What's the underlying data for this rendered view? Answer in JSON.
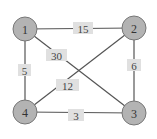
{
  "graph": {
    "nodes": [
      {
        "id": "1",
        "label": "1",
        "x": 25,
        "y": 29
      },
      {
        "id": "2",
        "label": "2",
        "x": 134,
        "y": 28
      },
      {
        "id": "3",
        "label": "3",
        "x": 134,
        "y": 113
      },
      {
        "id": "4",
        "label": "4",
        "x": 25,
        "y": 112
      }
    ],
    "edges": [
      {
        "from": "1",
        "to": "2",
        "weight": "15",
        "lx": 83,
        "ly": 28
      },
      {
        "from": "1",
        "to": "3",
        "weight": "30",
        "lx": 56,
        "ly": 55
      },
      {
        "from": "1",
        "to": "4",
        "weight": "5",
        "lx": 24,
        "ly": 70
      },
      {
        "from": "2",
        "to": "3",
        "weight": "6",
        "lx": 134,
        "ly": 65
      },
      {
        "from": "2",
        "to": "4",
        "weight": "12",
        "lx": 68,
        "ly": 85
      },
      {
        "from": "4",
        "to": "3",
        "weight": "3",
        "lx": 76,
        "ly": 115
      }
    ]
  }
}
